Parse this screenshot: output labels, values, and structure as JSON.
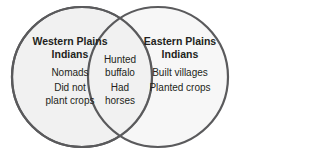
{
  "diagram": {
    "type": "venn",
    "left": {
      "title": "Western Plains Indians",
      "title_line1": "Western Plains",
      "title_line2": "Indians",
      "items": [
        "Nomads",
        "Did not plant crops"
      ],
      "item2_line1": "Did not",
      "item2_line2": "plant crops"
    },
    "right": {
      "title": "Eastern Plains Indians",
      "title_line1": "Eastern Plains",
      "title_line2": "Indians",
      "items": [
        "Built villages",
        "Planted crops"
      ]
    },
    "overlap": {
      "items": [
        "Hunted buffalo",
        "Had horses"
      ],
      "item1_line1": "Hunted",
      "item1_line2": "buffalo",
      "item2_line1": "Had",
      "item2_line2": "horses"
    },
    "colors": {
      "fill": "#f2f2f2",
      "stroke": "#58585a",
      "text": "#231f20"
    }
  }
}
